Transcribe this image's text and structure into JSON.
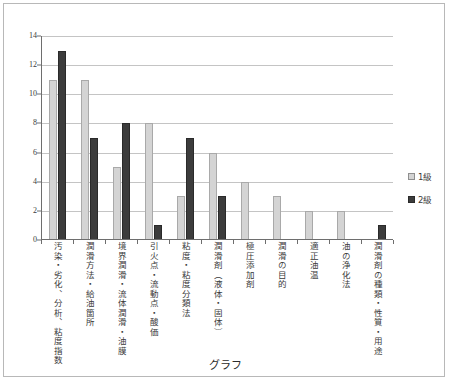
{
  "chart_data": {
    "type": "bar",
    "title": "",
    "xlabel": "グラフ",
    "ylabel": "",
    "ylim": [
      0,
      14
    ],
    "ytick_step": 2,
    "yticks": [
      "0",
      "2",
      "4",
      "6",
      "8",
      "10",
      "12",
      "14"
    ],
    "grid": true,
    "legend_position": "right",
    "categories": [
      "汚染・劣化、分析、粘度指数",
      "潤滑方法・給油箇所",
      "境界潤滑・流体潤滑・油膜",
      "引火点・流動点・酸価",
      "粘度・粘度分類法",
      "潤滑剤（液体・固体）",
      "極圧添加剤",
      "潤滑の目的",
      "適正油温",
      "油の浄化法",
      "潤滑剤の種類・性質・用途"
    ],
    "series": [
      {
        "name": "1級",
        "color": "#d4d4d4",
        "values": [
          11,
          11,
          5,
          8,
          3,
          6,
          4,
          3,
          2,
          2,
          0
        ]
      },
      {
        "name": "2級",
        "color": "#3c3c3c",
        "values": [
          13,
          7,
          8,
          1,
          7,
          3,
          0,
          0,
          0,
          0,
          1
        ]
      }
    ]
  },
  "legend": {
    "items": [
      {
        "label": "1級",
        "swatch": "series-1-swatch"
      },
      {
        "label": "2級",
        "swatch": "series-2-swatch"
      }
    ]
  },
  "axis": {
    "x_title": "グラフ"
  }
}
